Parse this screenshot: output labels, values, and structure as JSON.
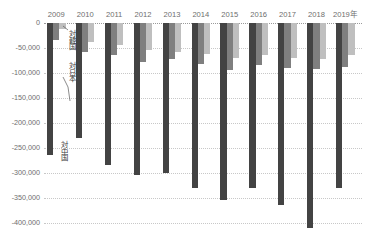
{
  "chart_data": {
    "type": "bar",
    "title": "",
    "subtitle": "",
    "xlabel": "",
    "ylabel": "",
    "categories": [
      "2009",
      "2010",
      "2011",
      "2012",
      "2013",
      "2014",
      "2015",
      "2016",
      "2017",
      "2018",
      "2019年"
    ],
    "ylim": [
      -425000,
      0
    ],
    "yticks": [
      0,
      -50000,
      -100000,
      -150000,
      -200000,
      -250000,
      -300000,
      -350000,
      -400000
    ],
    "ytick_labels": [
      "0",
      "-50,000",
      "-100,000",
      "-150,000",
      "-200,000",
      "-250,000",
      "-300,000",
      "-350,000",
      "-400,000"
    ],
    "grid": true,
    "legend": "none",
    "series": [
      {
        "name": "対中国",
        "color": "#434343",
        "values": [
          -265000,
          -230000,
          -285000,
          -305000,
          -300000,
          -330000,
          -355000,
          -330000,
          -365000,
          -410000,
          -330000
        ]
      },
      {
        "name": "対日本",
        "color": "#7f7f7f",
        "values": [
          -35000,
          -58000,
          -65000,
          -78000,
          -72000,
          -82000,
          -95000,
          -85000,
          -90000,
          -92000,
          -88000
        ]
      },
      {
        "name": "対韓国",
        "color": "#bfbfbf",
        "values": [
          -12000,
          -38000,
          -45000,
          -55000,
          -58000,
          -62000,
          -70000,
          -65000,
          -70000,
          -72000,
          -65000
        ]
      }
    ],
    "annotations": [
      {
        "text": "対韓国",
        "target_series": "対韓国",
        "target_category": "2009"
      },
      {
        "text": "対日本",
        "target_series": "対日本",
        "target_category": "2009"
      },
      {
        "text": "対中国",
        "target_series": "対中国",
        "target_category": "2009"
      }
    ]
  }
}
